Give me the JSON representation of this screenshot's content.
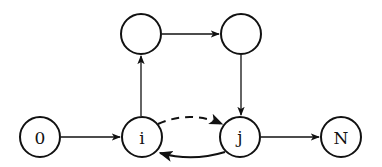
{
  "diagram": {
    "type": "directed-graph",
    "nodes": [
      {
        "id": "n0",
        "label": "0",
        "x": 40,
        "y": 137
      },
      {
        "id": "ni",
        "label": "i",
        "x": 142,
        "y": 137
      },
      {
        "id": "nj",
        "label": "j",
        "x": 240,
        "y": 137
      },
      {
        "id": "nN",
        "label": "N",
        "x": 341,
        "y": 137
      },
      {
        "id": "ntl",
        "label": "",
        "x": 141,
        "y": 34
      },
      {
        "id": "ntr",
        "label": "",
        "x": 241,
        "y": 34
      }
    ],
    "edges": [
      {
        "from": "0",
        "to": "i",
        "style": "solid"
      },
      {
        "from": "i",
        "to": "top-left",
        "style": "solid"
      },
      {
        "from": "top-left",
        "to": "top-right",
        "style": "solid"
      },
      {
        "from": "top-right",
        "to": "j",
        "style": "solid"
      },
      {
        "from": "i",
        "to": "j",
        "style": "dashed",
        "curve": "arc-above"
      },
      {
        "from": "j",
        "to": "i",
        "style": "solid",
        "curve": "arc-below"
      },
      {
        "from": "j",
        "to": "N",
        "style": "solid"
      }
    ]
  }
}
